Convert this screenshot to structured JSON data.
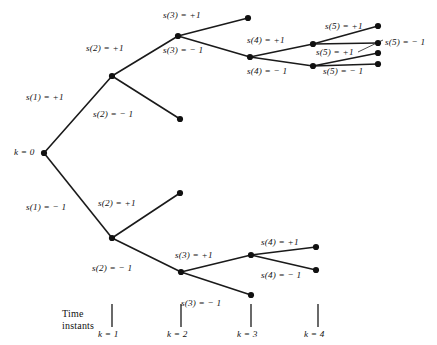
{
  "diagram": {
    "root_label": "k = 0",
    "caption": {
      "line1": "Time",
      "line2": "instants"
    },
    "axis_ticks": [
      {
        "label": "k = 1",
        "x": 112
      },
      {
        "label": "k = 2",
        "x": 181
      },
      {
        "label": "k = 3",
        "x": 251
      },
      {
        "label": "k = 4",
        "x": 318
      }
    ],
    "nodes": [
      {
        "id": "root",
        "x": 44,
        "y": 153
      },
      {
        "id": "n1p",
        "x": 112,
        "y": 76
      },
      {
        "id": "n1m",
        "x": 112,
        "y": 238
      },
      {
        "id": "n2pp",
        "x": 178,
        "y": 36
      },
      {
        "id": "n2pm",
        "x": 180,
        "y": 119
      },
      {
        "id": "n2mp",
        "x": 180,
        "y": 193
      },
      {
        "id": "n2mm",
        "x": 181,
        "y": 272
      },
      {
        "id": "n3ppp",
        "x": 248,
        "y": 18
      },
      {
        "id": "n3ppm",
        "x": 250,
        "y": 57
      },
      {
        "id": "n3mmp",
        "x": 251,
        "y": 255
      },
      {
        "id": "n3mmm",
        "x": 251,
        "y": 295
      },
      {
        "id": "n4a",
        "x": 313,
        "y": 44
      },
      {
        "id": "n4b",
        "x": 313,
        "y": 66
      },
      {
        "id": "n4c",
        "x": 316,
        "y": 247
      },
      {
        "id": "n4d",
        "x": 316,
        "y": 270
      },
      {
        "id": "n5a",
        "x": 378,
        "y": 26
      },
      {
        "id": "n5b",
        "x": 378,
        "y": 43
      },
      {
        "id": "n5c",
        "x": 378,
        "y": 53
      },
      {
        "id": "n5d",
        "x": 378,
        "y": 64
      }
    ],
    "edges": [
      {
        "from": "root",
        "to": "n1p"
      },
      {
        "from": "root",
        "to": "n1m"
      },
      {
        "from": "n1p",
        "to": "n2pp"
      },
      {
        "from": "n1p",
        "to": "n2pm"
      },
      {
        "from": "n1m",
        "to": "n2mp"
      },
      {
        "from": "n1m",
        "to": "n2mm"
      },
      {
        "from": "n2pp",
        "to": "n3ppp"
      },
      {
        "from": "n2pp",
        "to": "n3ppm"
      },
      {
        "from": "n2mm",
        "to": "n3mmp"
      },
      {
        "from": "n2mm",
        "to": "n3mmm"
      },
      {
        "from": "n3ppm",
        "to": "n4a"
      },
      {
        "from": "n3ppm",
        "to": "n4b"
      },
      {
        "from": "n3mmp",
        "to": "n4c"
      },
      {
        "from": "n3mmp",
        "to": "n4d"
      },
      {
        "from": "n4a",
        "to": "n5a"
      },
      {
        "from": "n4a",
        "to": "n5b"
      },
      {
        "from": "n4b",
        "to": "n5c"
      },
      {
        "from": "n4b",
        "to": "n5d"
      }
    ],
    "edge_labels": [
      {
        "text": "s(1) = +1",
        "x": 26,
        "y": 93
      },
      {
        "text": "s(1) = − 1",
        "x": 26,
        "y": 203
      },
      {
        "text": "s(2) = +1",
        "x": 86,
        "y": 44
      },
      {
        "text": "s(2) = − 1",
        "x": 93,
        "y": 110
      },
      {
        "text": "s(2) = +1",
        "x": 98,
        "y": 199
      },
      {
        "text": "s(2) = − 1",
        "x": 92,
        "y": 264
      },
      {
        "text": "s(3) = +1",
        "x": 163,
        "y": 11
      },
      {
        "text": "s(3) = − 1",
        "x": 163,
        "y": 46
      },
      {
        "text": "s(3) = +1",
        "x": 175,
        "y": 251
      },
      {
        "text": "s(3) = − 1",
        "x": 181,
        "y": 299
      },
      {
        "text": "s(4) = +1",
        "x": 247,
        "y": 36
      },
      {
        "text": "s(4) = − 1",
        "x": 247,
        "y": 67
      },
      {
        "text": "s(4) = +1",
        "x": 261,
        "y": 238
      },
      {
        "text": "s(4) = − 1",
        "x": 261,
        "y": 271
      },
      {
        "text": "s(5) = +1",
        "x": 325,
        "y": 22
      },
      {
        "text": "s(5) = − 1",
        "x": 385,
        "y": 38
      },
      {
        "text": "s(5) = +1",
        "x": 316,
        "y": 48
      },
      {
        "text": "s(5) = − 1",
        "x": 323,
        "y": 67
      }
    ],
    "leader": {
      "x1": 383,
      "y1": 40,
      "x2": 358,
      "y2": 52
    },
    "root_label_pos": {
      "x": 14,
      "y": 148
    },
    "caption_pos": {
      "x": 62,
      "y": 308
    },
    "tick_geometry": {
      "y_top": 304,
      "y_bottom": 327,
      "label_y": 330
    },
    "colors": {
      "stroke": "#1a1a1a",
      "node_fill": "#111111",
      "text": "#111111",
      "background": "#ffffff"
    }
  }
}
